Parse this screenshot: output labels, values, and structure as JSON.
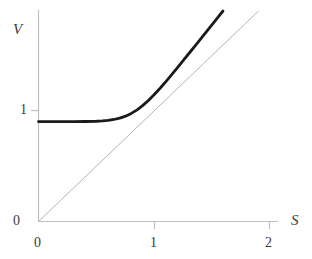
{
  "chart_data": {
    "type": "line",
    "title": "",
    "xlabel": "S",
    "ylabel": "V",
    "xlim": [
      0,
      2.07
    ],
    "ylim": [
      0,
      1.9
    ],
    "grid": false,
    "legend": null,
    "xticks": [
      {
        "value": 0,
        "label": "0"
      },
      {
        "value": 1,
        "label": "1"
      },
      {
        "value": 2,
        "label": "2"
      }
    ],
    "yticks": [
      {
        "value": 0,
        "label": "0"
      },
      {
        "value": 1,
        "label": "1"
      }
    ],
    "series": [
      {
        "name": "option-value-curve",
        "style": "solid-thick-black",
        "color": "#1a1a1a",
        "width": 2.8,
        "points": [
          [
            0.0,
            0.9
          ],
          [
            0.1,
            0.9
          ],
          [
            0.2,
            0.9
          ],
          [
            0.3,
            0.9
          ],
          [
            0.4,
            0.901
          ],
          [
            0.5,
            0.903
          ],
          [
            0.55,
            0.906
          ],
          [
            0.6,
            0.911
          ],
          [
            0.65,
            0.919
          ],
          [
            0.7,
            0.931
          ],
          [
            0.75,
            0.949
          ],
          [
            0.8,
            0.974
          ],
          [
            0.85,
            1.006
          ],
          [
            0.9,
            1.046
          ],
          [
            0.95,
            1.093
          ],
          [
            1.0,
            1.146
          ],
          [
            1.05,
            1.203
          ],
          [
            1.1,
            1.263
          ],
          [
            1.15,
            1.325
          ],
          [
            1.2,
            1.389
          ],
          [
            1.25,
            1.453
          ],
          [
            1.3,
            1.518
          ],
          [
            1.35,
            1.583
          ],
          [
            1.4,
            1.648
          ],
          [
            1.45,
            1.713
          ],
          [
            1.5,
            1.779
          ],
          [
            1.55,
            1.844
          ],
          [
            1.6,
            1.909
          ],
          [
            1.65,
            1.974
          ],
          [
            1.7,
            2.039
          ],
          [
            1.75,
            2.104
          ],
          [
            1.8,
            2.169
          ],
          [
            1.85,
            2.234
          ],
          [
            1.9,
            2.299
          ],
          [
            1.93,
            2.338
          ]
        ]
      },
      {
        "name": "intrinsic-value-line",
        "style": "solid-thin-gray",
        "color": "#b4b4b4",
        "width": 1,
        "points": [
          [
            0,
            0
          ],
          [
            2.0,
            2.0
          ]
        ]
      }
    ],
    "annotations": [],
    "asymptote_value": 0.9
  },
  "axes": {
    "y_axis_label": "V",
    "x_axis_label": "S",
    "axis_color": "#b8b8b8",
    "tick_color": "#b8b8b8",
    "text_color": "#3a3a3a"
  },
  "labels": {
    "y_title": "V",
    "x_title": "S",
    "y_tick_1": "1",
    "y_tick_0": "0",
    "x_tick_0": "0",
    "x_tick_1": "1",
    "x_tick_2": "2"
  }
}
